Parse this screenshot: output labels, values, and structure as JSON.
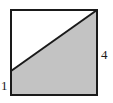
{
  "figure": {
    "kind": "geometry-diagram",
    "background_color": "#ffffff",
    "stroke_color": "#1a1a1a",
    "shaded_fill_color": "#c3c3c3",
    "unshaded_fill_color": "#ffffff",
    "stroke_width": 2,
    "square": {
      "name": "square-outline",
      "left": 11,
      "top": 10,
      "right": 97,
      "bottom": 95
    },
    "diagonal": {
      "name": "diagonal-line",
      "x1": 11,
      "y1": 71,
      "x2": 97,
      "y2": 10
    },
    "shaded_region": {
      "name": "shaded-trapezoid",
      "points": "11,71 97,10 97,95 11,95"
    },
    "unshaded_region": {
      "name": "unshaded-triangle",
      "points": "11,10 97,10 11,71"
    },
    "labels": {
      "left": {
        "name": "left-side-length-label",
        "text": "1",
        "position": "bottom-left-outside"
      },
      "right": {
        "name": "right-side-length-label",
        "text": "4",
        "position": "middle-right-outside"
      }
    }
  }
}
